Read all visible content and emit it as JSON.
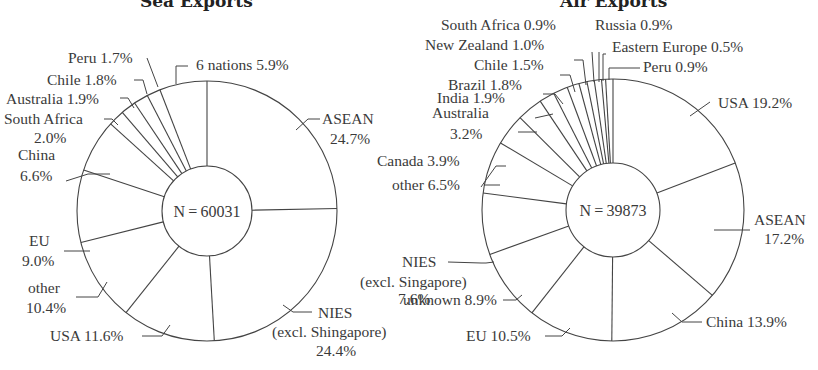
{
  "chart_data": [
    {
      "type": "pie",
      "title": "Sea Exports",
      "center_label": "N = 60031",
      "n": 60031,
      "start": "12 o'clock, clockwise",
      "donut": true,
      "categories": [
        "ASEAN",
        "NIES (excl. Shingapore)",
        "USA",
        "other",
        "EU",
        "China",
        "South Africa",
        "Australia",
        "Chile",
        "Peru",
        "6 nations"
      ],
      "values": [
        24.7,
        24.4,
        11.6,
        10.4,
        9.0,
        6.6,
        2.0,
        1.9,
        1.8,
        1.7,
        5.9
      ],
      "unit": "%"
    },
    {
      "type": "pie",
      "title": "Air Exports",
      "center_label": "N = 39873",
      "n": 39873,
      "start": "12 o'clock, clockwise",
      "donut": true,
      "categories": [
        "USA",
        "ASEAN",
        "China",
        "EU",
        "unknown",
        "NIES (excl. Singapore)",
        "other",
        "Canada",
        "Australia",
        "India",
        "Brazil",
        "Chile",
        "New Zealand",
        "South Africa",
        "Russia",
        "Eastern Europe",
        "Peru"
      ],
      "values": [
        19.2,
        17.2,
        13.9,
        10.5,
        8.9,
        7.6,
        6.5,
        3.9,
        3.2,
        1.9,
        1.8,
        1.5,
        1.0,
        0.9,
        0.9,
        0.5,
        0.9
      ],
      "unit": "%"
    }
  ],
  "titles": {
    "left": "Sea Exports",
    "right": "Air Exports"
  },
  "left": {
    "center": "N = 60031",
    "labels": {
      "asean_1": "ASEAN",
      "asean_2": "24.7%",
      "nies_1": "NIES",
      "nies_2": "(excl. Shingapore)",
      "nies_3": "24.4%",
      "usa": "USA 11.6%",
      "other_1": "other",
      "other_2": "10.4%",
      "eu_1": "EU",
      "eu_2": "9.0%",
      "china_1": "China",
      "china_2": "6.6%",
      "safrica_1": "South Africa",
      "safrica_2": "2.0%",
      "australia": "Australia 1.9%",
      "chile": "Chile 1.8%",
      "peru": "Peru 1.7%",
      "six": "6 nations 5.9%"
    }
  },
  "right": {
    "center": "N = 39873",
    "labels": {
      "usa": "USA 19.2%",
      "asean_1": "ASEAN",
      "asean_2": "17.2%",
      "china": "China 13.9%",
      "eu": "EU 10.5%",
      "unknown": "unknown 8.9%",
      "nies_1": "NIES",
      "nies_2": "(excl. Singapore)",
      "nies_3": "7.6%",
      "other": "other 6.5%",
      "canada": "Canada 3.9%",
      "australia_1": "Australia",
      "australia_2": "3.2%",
      "india": "India 1.9%",
      "brazil": "Brazil 1.8%",
      "chile": "Chile 1.5%",
      "nz": "New Zealand 1.0%",
      "safrica": "South Africa 0.9%",
      "russia": "Russia 0.9%",
      "eeurope": "Eastern Europe 0.5%",
      "peru": "Peru 0.9%"
    }
  }
}
